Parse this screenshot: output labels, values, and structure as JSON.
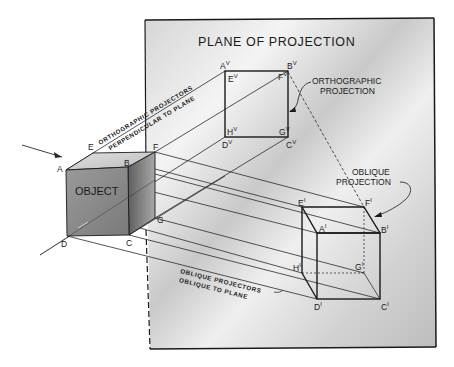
{
  "diagram": {
    "title": "PLANE OF PROJECTION",
    "object_label": "OBJECT",
    "orthographic_callout": [
      "ORTHOGRAPHIC",
      "PROJECTION"
    ],
    "oblique_callout": [
      "OBLIQUE",
      "PROJECTION"
    ],
    "ortho_projectors_note": [
      "ORTHOGRAPHIC PROJECTORS",
      "PERPENDICULAR TO PLANE"
    ],
    "oblique_projectors_note": [
      "OBLIQUE PROJECTORS",
      "OBLIQUE TO PLANE"
    ],
    "object_vertices": {
      "A": "A",
      "B": "B",
      "C": "C",
      "D": "D",
      "E": "E",
      "F": "F",
      "G": "G"
    },
    "ortho_vertices": [
      {
        "base": "A",
        "sup": "V"
      },
      {
        "base": "B",
        "sup": "V"
      },
      {
        "base": "E",
        "sup": "V"
      },
      {
        "base": "F",
        "sup": "V"
      },
      {
        "base": "H",
        "sup": "V"
      },
      {
        "base": "G",
        "sup": "V"
      },
      {
        "base": "D",
        "sup": "V"
      },
      {
        "base": "C",
        "sup": "V"
      }
    ],
    "oblique_vertices": [
      {
        "base": "E",
        "sup": "I"
      },
      {
        "base": "F",
        "sup": "I"
      },
      {
        "base": "A",
        "sup": "I"
      },
      {
        "base": "B",
        "sup": "I"
      },
      {
        "base": "H",
        "sup": "I"
      },
      {
        "base": "G",
        "sup": "I"
      },
      {
        "base": "D",
        "sup": "I"
      },
      {
        "base": "C",
        "sup": "I"
      }
    ],
    "colors": {
      "plane_fill_light": "#f2f2f2",
      "plane_fill_dark": "#bdbdbd",
      "ink": "#1a1a1a",
      "cube_front": "#8e8e8e",
      "cube_top": "#cfcfcf",
      "cube_side": "#6e6e6e"
    }
  }
}
